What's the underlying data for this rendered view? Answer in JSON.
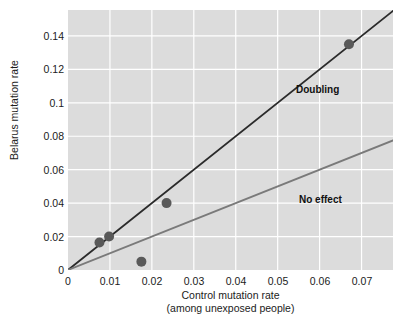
{
  "chart_data": {
    "type": "scatter",
    "title": "",
    "xlabel": "Control mutation rate",
    "xlabel_line2": "(among unexposed people)",
    "ylabel": "Belarus mutation rate",
    "xlim": [
      0,
      0.0775
    ],
    "ylim": [
      0,
      0.1555
    ],
    "xticks": [
      0,
      0.01,
      0.02,
      0.03,
      0.04,
      0.05,
      0.06,
      0.07
    ],
    "xticklabels": [
      "0",
      "0.01",
      "0.02",
      "0.03",
      "0.04",
      "0.05",
      "0.06",
      "0.07"
    ],
    "yticks": [
      0,
      0.02,
      0.04,
      0.06,
      0.08,
      0.1,
      0.12,
      0.14
    ],
    "yticklabels": [
      "0",
      "0.02",
      "0.04",
      "0.06",
      "0.08",
      "0.1",
      "0.12",
      "0.14"
    ],
    "grid": true,
    "grid_color": "#ffffff",
    "panel_color": "#dcdcdc",
    "legend": "none",
    "points": [
      {
        "x": 0.0075,
        "y": 0.0165
      },
      {
        "x": 0.0098,
        "y": 0.02
      },
      {
        "x": 0.0175,
        "y": 0.005
      },
      {
        "x": 0.0235,
        "y": 0.04
      },
      {
        "x": 0.067,
        "y": 0.135
      }
    ],
    "point_color": "#595959",
    "point_size": 5,
    "lines": [
      {
        "name": "Doubling",
        "label": "Doubling",
        "slope": 2,
        "intercept": 0,
        "color": "#2b2b2b",
        "width": 1.8,
        "label_x": 0.0545,
        "label_y": 0.1045
      },
      {
        "name": "No effect",
        "label": "No effect",
        "slope": 1,
        "intercept": 0,
        "color": "#7a7a7a",
        "width": 1.8,
        "label_x": 0.0552,
        "label_y": 0.0395
      }
    ]
  }
}
